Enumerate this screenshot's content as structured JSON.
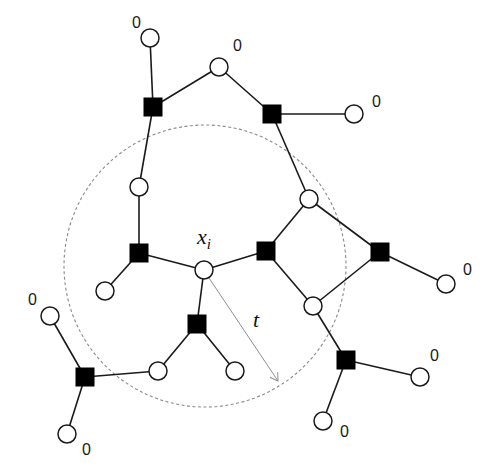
{
  "diagram": {
    "type": "factor-graph",
    "colors": {
      "background": "#ffffff",
      "edge": "#1a1a1a",
      "factor_fill": "#000000",
      "variable_fill": "#ffffff",
      "dashed_circle": "#8a8a8a",
      "radius_arrow": "#8f8f8f"
    },
    "neighborhood_circle": {
      "cx": 205,
      "cy": 266,
      "r": 141
    },
    "center_label": {
      "text": "x",
      "subscript": "i",
      "x": 197,
      "y": 244
    },
    "radius_label": {
      "text": "t",
      "x": 253,
      "y": 327
    },
    "radius_arrow": {
      "x1": 207,
      "y1": 275,
      "x2": 278,
      "y2": 381
    },
    "variable_nodes": [
      {
        "id": "v1",
        "x": 150,
        "y": 38,
        "r": 9
      },
      {
        "id": "v2",
        "x": 219,
        "y": 67,
        "r": 9
      },
      {
        "id": "v3",
        "x": 354,
        "y": 114,
        "r": 9
      },
      {
        "id": "v4",
        "x": 139,
        "y": 187,
        "r": 9
      },
      {
        "id": "v5",
        "x": 309,
        "y": 199,
        "r": 9
      },
      {
        "id": "xi",
        "x": 204,
        "y": 270,
        "r": 9
      },
      {
        "id": "v7",
        "x": 105,
        "y": 291,
        "r": 9
      },
      {
        "id": "v8",
        "x": 313,
        "y": 306,
        "r": 9
      },
      {
        "id": "v9",
        "x": 50,
        "y": 316,
        "r": 9
      },
      {
        "id": "v10",
        "x": 158,
        "y": 371,
        "r": 9
      },
      {
        "id": "v11",
        "x": 235,
        "y": 371,
        "r": 9
      },
      {
        "id": "v12",
        "x": 446,
        "y": 284,
        "r": 9
      },
      {
        "id": "v13",
        "x": 420,
        "y": 377,
        "r": 9
      },
      {
        "id": "v14",
        "x": 323,
        "y": 421,
        "r": 9
      },
      {
        "id": "v15",
        "x": 67,
        "y": 434,
        "r": 9
      }
    ],
    "factor_nodes": [
      {
        "id": "f1",
        "x": 153,
        "y": 107,
        "size": 18
      },
      {
        "id": "f2",
        "x": 272,
        "y": 114,
        "size": 18
      },
      {
        "id": "f3",
        "x": 139,
        "y": 253,
        "size": 18
      },
      {
        "id": "f4",
        "x": 266,
        "y": 251,
        "size": 18
      },
      {
        "id": "f5",
        "x": 380,
        "y": 252,
        "size": 18
      },
      {
        "id": "f6",
        "x": 197,
        "y": 324,
        "size": 18
      },
      {
        "id": "f7",
        "x": 85,
        "y": 377,
        "size": 18
      },
      {
        "id": "f8",
        "x": 346,
        "y": 360,
        "size": 18
      }
    ],
    "edges": [
      [
        "v1",
        "f1"
      ],
      [
        "f1",
        "v2"
      ],
      [
        "f1",
        "v4"
      ],
      [
        "v2",
        "f2"
      ],
      [
        "f2",
        "v3"
      ],
      [
        "f2",
        "v5"
      ],
      [
        "v4",
        "f3"
      ],
      [
        "f3",
        "v7"
      ],
      [
        "f3",
        "xi"
      ],
      [
        "xi",
        "f4"
      ],
      [
        "xi",
        "f6"
      ],
      [
        "f4",
        "v5"
      ],
      [
        "f4",
        "v8"
      ],
      [
        "v5",
        "f5"
      ],
      [
        "v8",
        "f5"
      ],
      [
        "f5",
        "v12"
      ],
      [
        "v8",
        "f8"
      ],
      [
        "f8",
        "v13"
      ],
      [
        "f8",
        "v14"
      ],
      [
        "f6",
        "v10"
      ],
      [
        "f6",
        "v11"
      ],
      [
        "v10",
        "f7"
      ],
      [
        "f7",
        "v9"
      ],
      [
        "f7",
        "v15"
      ]
    ],
    "leaf_labels": [
      {
        "text": "0",
        "x": 132,
        "y": 28
      },
      {
        "text": "0",
        "x": 233,
        "y": 51
      },
      {
        "text": "0",
        "x": 372,
        "y": 107
      },
      {
        "text": "0",
        "x": 463,
        "y": 275
      },
      {
        "text": "0",
        "x": 430,
        "y": 361
      },
      {
        "text": "0",
        "x": 28,
        "y": 305
      },
      {
        "text": "0",
        "x": 82,
        "y": 455
      },
      {
        "text": "0",
        "x": 340,
        "y": 437
      }
    ]
  }
}
